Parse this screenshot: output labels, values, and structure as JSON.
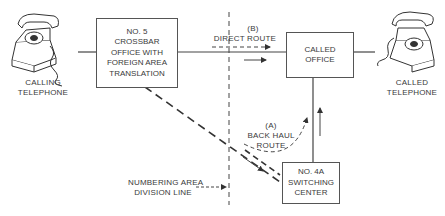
{
  "nodes": {
    "calling_telephone": {
      "line1": "CALLING",
      "line2": "TELEPHONE"
    },
    "crossbar_office": {
      "lines": [
        "NO. 5",
        "CROSSBAR",
        "OFFICE WITH",
        "FOREIGN AREA",
        "TRANSLATION"
      ]
    },
    "called_office": {
      "lines": [
        "CALLED",
        "OFFICE"
      ]
    },
    "called_telephone": {
      "line1": "CALLED",
      "line2": "TELEPHONE"
    },
    "switching_center": {
      "lines": [
        "NO. 4A",
        "SWITCHING",
        "CENTER"
      ]
    }
  },
  "routes": {
    "direct": {
      "tag": "(B)",
      "label": "DIRECT ROUTE"
    },
    "back_haul": {
      "tag": "(A)",
      "label1": "BACK HAUL",
      "label2": "ROUTE"
    }
  },
  "division_line": {
    "label1": "NUMBERING AREA",
    "label2": "DIVISION LINE"
  }
}
